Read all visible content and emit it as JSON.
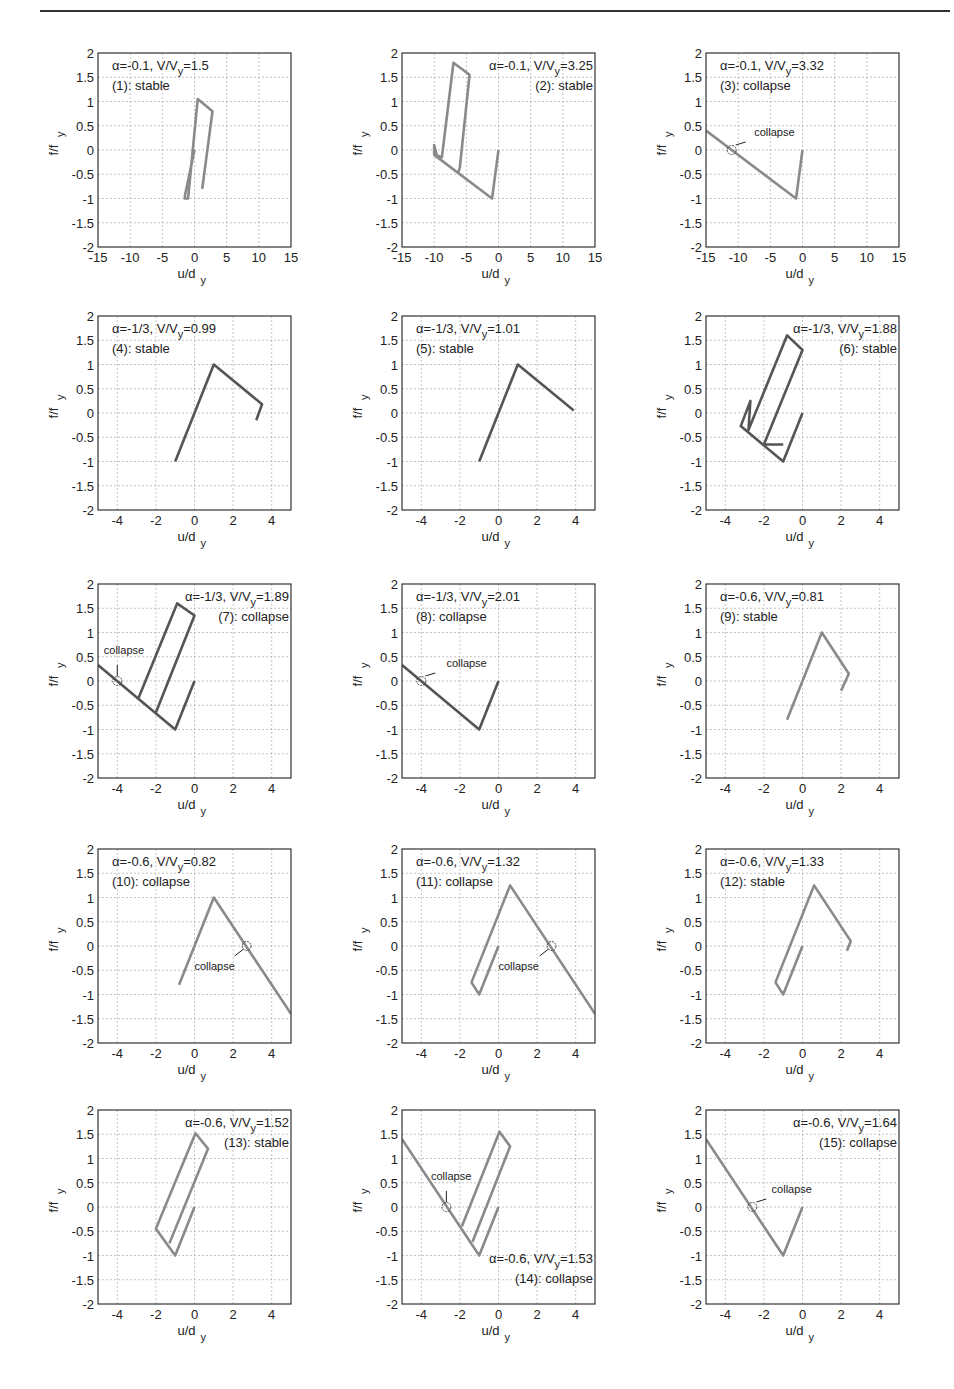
{
  "chart_data": [
    {
      "id": 1,
      "type": "line",
      "title": "",
      "alpha": "-0.1",
      "vv": "1.5",
      "status": "(1): stable",
      "label_pos": "top-left",
      "xlim": [
        -15,
        15
      ],
      "ylim": [
        -2,
        2
      ],
      "xticks": [
        -15,
        -10,
        -5,
        0,
        5,
        10,
        15
      ],
      "yticks": [
        -2,
        -1.5,
        -1,
        -0.5,
        0,
        0.5,
        1,
        1.5,
        2
      ],
      "xlabel": "u/d_y",
      "ylabel": "f/f_y",
      "grid": true,
      "shade": "#8a8a8a",
      "x": [
        0,
        -1.5,
        -1.5,
        -1.0,
        0.5,
        2.8,
        1.2
      ],
      "y": [
        0,
        -0.95,
        -1.0,
        -1.0,
        1.05,
        0.8,
        -0.8
      ],
      "collapse": null
    },
    {
      "id": 2,
      "type": "line",
      "alpha": "-0.1",
      "vv": "3.25",
      "status": "(2): stable",
      "label_pos": "top-right",
      "xlim": [
        -15,
        15
      ],
      "ylim": [
        -2,
        2
      ],
      "xticks": [
        -15,
        -10,
        -5,
        0,
        5,
        10,
        15
      ],
      "yticks": [
        -2,
        -1.5,
        -1,
        -0.5,
        0,
        0.5,
        1,
        1.5,
        2
      ],
      "xlabel": "u/d_y",
      "ylabel": "f/f_y",
      "grid": true,
      "shade": "#8a8a8a",
      "x": [
        0,
        -1,
        -10,
        -10,
        -9.5,
        -9.8,
        -8.8,
        -7,
        -4.5,
        -6,
        -6.2
      ],
      "y": [
        0,
        -1,
        -0.1,
        0.1,
        -0.15,
        -0.1,
        -0.15,
        1.8,
        1.55,
        -0.35,
        -0.45
      ],
      "collapse": null
    },
    {
      "id": 3,
      "type": "line",
      "alpha": "-0.1",
      "vv": "3.32",
      "status": "(3): collapse",
      "label_pos": "top-left",
      "xlim": [
        -15,
        15
      ],
      "ylim": [
        -2,
        2
      ],
      "xticks": [
        -15,
        -10,
        -5,
        0,
        5,
        10,
        15
      ],
      "yticks": [
        -2,
        -1.5,
        -1,
        -0.5,
        0,
        0.5,
        1,
        1.5,
        2
      ],
      "xlabel": "u/d_y",
      "ylabel": "f/f_y",
      "grid": true,
      "shade": "#8a8a8a",
      "x": [
        0,
        -1,
        -15
      ],
      "y": [
        0,
        -1,
        0.4
      ],
      "collapse": {
        "x": -11,
        "y": 0,
        "label": "collapse",
        "label_x": -7.5,
        "label_y": 0.28
      }
    },
    {
      "id": 4,
      "type": "line",
      "alpha": "-1/3",
      "vv": "0.99",
      "status": "(4): stable",
      "label_pos": "top-left",
      "xlim": [
        -5,
        5
      ],
      "ylim": [
        -2,
        2
      ],
      "xticks": [
        -4,
        -2,
        0,
        2,
        4
      ],
      "yticks": [
        -2,
        -1.5,
        -1,
        -0.5,
        0,
        0.5,
        1,
        1.5,
        2
      ],
      "xlabel": "u/d_y",
      "ylabel": "f/f_y",
      "grid": true,
      "shade": "#555555",
      "x": [
        -1,
        1,
        3.5,
        3.2
      ],
      "y": [
        -1,
        1,
        0.18,
        -0.15
      ],
      "collapse": null
    },
    {
      "id": 5,
      "type": "line",
      "alpha": "-1/3",
      "vv": "1.01",
      "status": "(5): stable",
      "label_pos": "top-left",
      "xlim": [
        -5,
        5
      ],
      "ylim": [
        -2,
        2
      ],
      "xticks": [
        -4,
        -2,
        0,
        2,
        4
      ],
      "yticks": [
        -2,
        -1.5,
        -1,
        -0.5,
        0,
        0.5,
        1,
        1.5,
        2
      ],
      "xlabel": "u/d_y",
      "ylabel": "f/f_y",
      "grid": true,
      "shade": "#555555",
      "x": [
        -1,
        1,
        3.9
      ],
      "y": [
        -1,
        1,
        0.05
      ],
      "collapse": null
    },
    {
      "id": 6,
      "type": "line",
      "alpha": "-1/3",
      "vv": "1.88",
      "status": "(6): stable",
      "label_pos": "top-right",
      "xlim": [
        -5,
        5
      ],
      "ylim": [
        -2,
        2
      ],
      "xticks": [
        -4,
        -2,
        0,
        2,
        4
      ],
      "yticks": [
        -2,
        -1.5,
        -1,
        -0.5,
        0,
        0.5,
        1,
        1.5,
        2
      ],
      "xlabel": "u/d_y",
      "ylabel": "f/f_y",
      "grid": true,
      "shade": "#555555",
      "x": [
        0,
        -1,
        -3.2,
        -2.7,
        -2.8,
        -0.8,
        0,
        -2,
        -1.0
      ],
      "y": [
        0,
        -1,
        -0.27,
        0.25,
        -0.35,
        1.6,
        1.3,
        -0.65,
        -0.65
      ],
      "collapse": null
    },
    {
      "id": 7,
      "type": "line",
      "alpha": "-1/3",
      "vv": "1.89",
      "status": "(7): collapse",
      "label_pos": "top-right",
      "xlim": [
        -5,
        5
      ],
      "ylim": [
        -2,
        2
      ],
      "xticks": [
        -4,
        -2,
        0,
        2,
        4
      ],
      "yticks": [
        -2,
        -1.5,
        -1,
        -0.5,
        0,
        0.5,
        1,
        1.5,
        2
      ],
      "xlabel": "u/d_y",
      "ylabel": "f/f_y",
      "grid": true,
      "shade": "#555555",
      "x": [
        0,
        -1,
        -5
      ],
      "y": [
        0,
        -1,
        0.33
      ],
      "loops": [
        {
          "x": [
            -2.9,
            -0.9,
            0,
            -2
          ],
          "y": [
            -0.35,
            1.6,
            1.35,
            -0.65
          ]
        }
      ],
      "collapse": {
        "x": -4,
        "y": 0,
        "label": "collapse",
        "label_x": -4.7,
        "label_y": 0.55,
        "arrow": "down"
      }
    },
    {
      "id": 8,
      "type": "line",
      "alpha": "-1/3",
      "vv": "2.01",
      "status": "(8): collapse",
      "label_pos": "top-left",
      "xlim": [
        -5,
        5
      ],
      "ylim": [
        -2,
        2
      ],
      "xticks": [
        -4,
        -2,
        0,
        2,
        4
      ],
      "yticks": [
        -2,
        -1.5,
        -1,
        -0.5,
        0,
        0.5,
        1,
        1.5,
        2
      ],
      "xlabel": "u/d_y",
      "ylabel": "f/f_y",
      "grid": true,
      "shade": "#555555",
      "x": [
        0,
        -1,
        -5
      ],
      "y": [
        0,
        -1,
        0.33
      ],
      "collapse": {
        "x": -4,
        "y": 0,
        "label": "collapse",
        "label_x": -2.7,
        "label_y": 0.28
      }
    },
    {
      "id": 9,
      "type": "line",
      "alpha": "-0.6",
      "vv": "0.81",
      "status": "(9): stable",
      "label_pos": "top-left",
      "xlim": [
        -5,
        5
      ],
      "ylim": [
        -2,
        2
      ],
      "xticks": [
        -4,
        -2,
        0,
        2,
        4
      ],
      "yticks": [
        -2,
        -1.5,
        -1,
        -0.5,
        0,
        0.5,
        1,
        1.5,
        2
      ],
      "xlabel": "u/d_y",
      "ylabel": "f/f_y",
      "grid": true,
      "shade": "#8a8a8a",
      "x": [
        -0.8,
        1,
        2.4,
        2.0
      ],
      "y": [
        -0.8,
        1,
        0.15,
        -0.2
      ],
      "collapse": null
    },
    {
      "id": 10,
      "type": "line",
      "alpha": "-0.6",
      "vv": "0.82",
      "status": "(10): collapse",
      "label_pos": "top-left",
      "xlim": [
        -5,
        5
      ],
      "ylim": [
        -2,
        2
      ],
      "xticks": [
        -4,
        -2,
        0,
        2,
        4
      ],
      "yticks": [
        -2,
        -1.5,
        -1,
        -0.5,
        0,
        0.5,
        1,
        1.5,
        2
      ],
      "xlabel": "u/d_y",
      "ylabel": "f/f_y",
      "grid": true,
      "shade": "#8a8a8a",
      "x": [
        -0.8,
        1,
        5
      ],
      "y": [
        -0.8,
        1,
        -1.4
      ],
      "collapse": {
        "x": 2.7,
        "y": 0,
        "label": "collapse",
        "label_x": 0,
        "label_y": -0.5
      }
    },
    {
      "id": 11,
      "type": "line",
      "alpha": "-0.6",
      "vv": "1.32",
      "status": "(11): collapse",
      "label_pos": "top-left",
      "xlim": [
        -5,
        5
      ],
      "ylim": [
        -2,
        2
      ],
      "xticks": [
        -4,
        -2,
        0,
        2,
        4
      ],
      "yticks": [
        -2,
        -1.5,
        -1,
        -0.5,
        0,
        0.5,
        1,
        1.5,
        2
      ],
      "xlabel": "u/d_y",
      "ylabel": "f/f_y",
      "grid": true,
      "shade": "#8a8a8a",
      "x": [
        0,
        -1,
        -1.4,
        0.6,
        5
      ],
      "y": [
        0,
        -1,
        -0.75,
        1.25,
        -1.4
      ],
      "collapse": {
        "x": 2.75,
        "y": 0,
        "label": "collapse",
        "label_x": 0,
        "label_y": -0.5
      }
    },
    {
      "id": 12,
      "type": "line",
      "alpha": "-0.6",
      "vv": "1.33",
      "status": "(12): stable",
      "label_pos": "top-left",
      "xlim": [
        -5,
        5
      ],
      "ylim": [
        -2,
        2
      ],
      "xticks": [
        -4,
        -2,
        0,
        2,
        4
      ],
      "yticks": [
        -2,
        -1.5,
        -1,
        -0.5,
        0,
        0.5,
        1,
        1.5,
        2
      ],
      "xlabel": "u/d_y",
      "ylabel": "f/f_y",
      "grid": true,
      "shade": "#8a8a8a",
      "x": [
        0,
        -1,
        -1.4,
        0.6,
        2.5,
        2.3
      ],
      "y": [
        0,
        -1,
        -0.75,
        1.25,
        0.1,
        -0.1
      ],
      "collapse": null
    },
    {
      "id": 13,
      "type": "line",
      "alpha": "-0.6",
      "vv": "1.52",
      "status": "(13): stable",
      "label_pos": "top-right",
      "xlim": [
        -5,
        5
      ],
      "ylim": [
        -2,
        2
      ],
      "xticks": [
        -4,
        -2,
        0,
        2,
        4
      ],
      "yticks": [
        -2,
        -1.5,
        -1,
        -0.5,
        0,
        0.5,
        1,
        1.5,
        2
      ],
      "xlabel": "u/d_y",
      "ylabel": "f/f_y",
      "grid": true,
      "shade": "#8a8a8a",
      "x": [
        0,
        -1,
        -2,
        0.05,
        0.7,
        -1.3
      ],
      "y": [
        0,
        -1,
        -0.45,
        1.52,
        1.2,
        -0.75
      ],
      "collapse": null
    },
    {
      "id": 14,
      "type": "line",
      "alpha": "-0.6",
      "vv": "1.53",
      "status": "(14): collapse",
      "label_pos": "bottom-right",
      "xlim": [
        -5,
        5
      ],
      "ylim": [
        -2,
        2
      ],
      "xticks": [
        -4,
        -2,
        0,
        2,
        4
      ],
      "yticks": [
        -2,
        -1.5,
        -1,
        -0.5,
        0,
        0.5,
        1,
        1.5,
        2
      ],
      "xlabel": "u/d_y",
      "ylabel": "f/f_y",
      "grid": true,
      "shade": "#8a8a8a",
      "x": [
        0,
        -1,
        -5
      ],
      "y": [
        0,
        -1,
        1.4
      ],
      "loops": [
        {
          "x": [
            -1.9,
            0.05,
            0.6,
            -1.35
          ],
          "y": [
            -0.4,
            1.55,
            1.25,
            -0.72
          ]
        }
      ],
      "collapse": {
        "x": -2.7,
        "y": 0,
        "label": "collapse",
        "label_x": -3.5,
        "label_y": 0.55,
        "arrow": "down"
      }
    },
    {
      "id": 15,
      "type": "line",
      "alpha": "-0.6",
      "vv": "1.64",
      "status": "(15): collapse",
      "label_pos": "top-right",
      "xlim": [
        -5,
        5
      ],
      "ylim": [
        -2,
        2
      ],
      "xticks": [
        -4,
        -2,
        0,
        2,
        4
      ],
      "yticks": [
        -2,
        -1.5,
        -1,
        -0.5,
        0,
        0.5,
        1,
        1.5,
        2
      ],
      "xlabel": "u/d_y",
      "ylabel": "f/f_y",
      "grid": true,
      "shade": "#8a8a8a",
      "x": [
        0,
        -1,
        -5
      ],
      "y": [
        0,
        -1,
        1.4
      ],
      "collapse": {
        "x": -2.6,
        "y": 0,
        "label": "collapse",
        "label_x": -1.6,
        "label_y": 0.28
      }
    }
  ],
  "layout": {
    "col_left": [
      98,
      402,
      706
    ],
    "row_top": [
      53,
      316,
      584,
      849,
      1110
    ],
    "box_w": 193,
    "box_h": 194
  },
  "labels": {
    "alpha_sym": "α",
    "vv_prefix": "V/V",
    "vv_sub": "y",
    "xlabel_main": "u/d",
    "xlabel_sub": "y",
    "ylabel_main": "f/f",
    "ylabel_sub": "y"
  }
}
